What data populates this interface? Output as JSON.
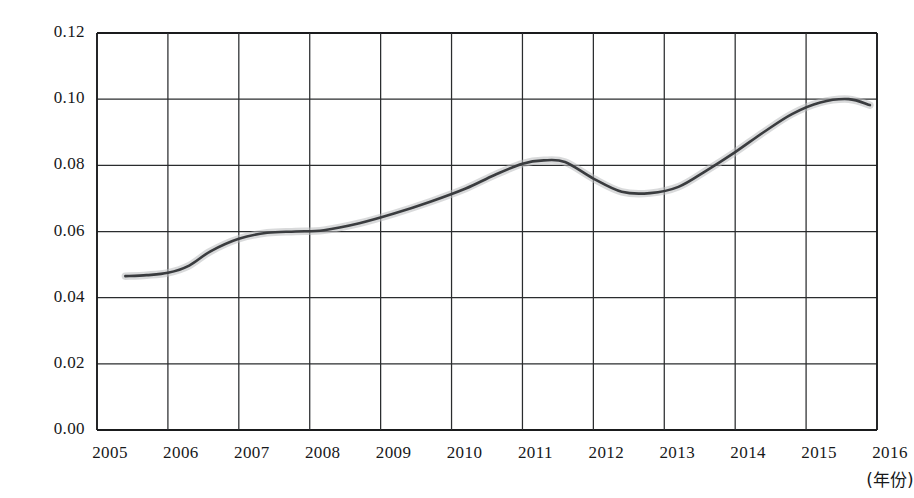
{
  "chart_data": {
    "type": "line",
    "title": "",
    "subtitle": "",
    "xlabel": "(年份)",
    "ylabel": "",
    "grid": true,
    "legend": false,
    "xlim": [
      2005,
      2016
    ],
    "ylim": [
      0.0,
      0.12
    ],
    "x_tick_labels": [
      "2005",
      "2006",
      "2007",
      "2008",
      "2009",
      "2010",
      "2011",
      "2012",
      "2013",
      "2014",
      "2015",
      "2016"
    ],
    "y_tick_labels": [
      "0.00",
      "0.02",
      "0.04",
      "0.06",
      "0.08",
      "0.10",
      "0.12"
    ],
    "y_ticks": [
      0.0,
      0.02,
      0.04,
      0.06,
      0.08,
      0.1,
      0.12
    ],
    "series": [
      {
        "name": "value",
        "x": [
          2005.4,
          2005.7,
          2006.0,
          2006.3,
          2006.6,
          2007.0,
          2007.4,
          2007.8,
          2008.2,
          2008.7,
          2009.2,
          2009.7,
          2010.2,
          2010.6,
          2011.0,
          2011.3,
          2011.6,
          2012.0,
          2012.4,
          2012.8,
          2013.2,
          2013.6,
          2014.0,
          2014.4,
          2014.8,
          2015.2,
          2015.6,
          2015.9
        ],
        "values": [
          0.0465,
          0.0468,
          0.0475,
          0.0497,
          0.054,
          0.0578,
          0.0596,
          0.06,
          0.0604,
          0.0625,
          0.0655,
          0.069,
          0.073,
          0.077,
          0.0805,
          0.0815,
          0.081,
          0.076,
          0.072,
          0.0716,
          0.0735,
          0.0785,
          0.084,
          0.09,
          0.0955,
          0.099,
          0.1,
          0.0982
        ]
      }
    ],
    "colors": {
      "line": "#3a3c3f",
      "grid": "#2a2c2e",
      "axis": "#1a1b1d",
      "halo": "#b9bbbd",
      "background": "#ffffff"
    },
    "axis_geometry": {
      "plot_left": 97,
      "plot_right": 877,
      "plot_top": 33,
      "plot_bottom": 430
    }
  }
}
